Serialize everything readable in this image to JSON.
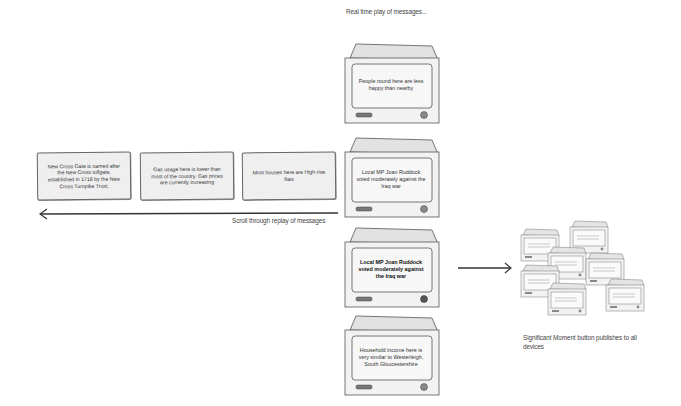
{
  "captions": {
    "realtime": "Real time play of messages...",
    "scroll": "Scroll through replay of messages",
    "significant": "Significant Moment button publishes to all devices"
  },
  "replay_messages": [
    "New Cross Gate is named after the New Cross tollgate, established in 1718 by the New Cross Turnpike Trust.",
    "Gas usage here is lower than most of the country. Gas prices are currently increasing",
    "Most houses here are High-rise flats"
  ],
  "devices": [
    {
      "text": "People round here are less happy than nearby",
      "highlighted": false
    },
    {
      "text": "Local MP Joan Ruddock voted moderately against the Iraq war",
      "highlighted": false
    },
    {
      "text": "Local MP Joan Ruddock voted moderately against the Iraq war",
      "highlighted": true
    },
    {
      "text": "Household income here is very similar to Westerleigh, South Gloucestershire",
      "highlighted": false
    }
  ],
  "published_devices": {
    "count": 8,
    "text": "Local MP Joan Ruddock voted moderately against the Iraq war"
  },
  "colors": {
    "device_fill": "#f2f2f2",
    "device_stroke": "#555555",
    "screen_fill": "#f7f7f7",
    "arrow": "#333333"
  }
}
